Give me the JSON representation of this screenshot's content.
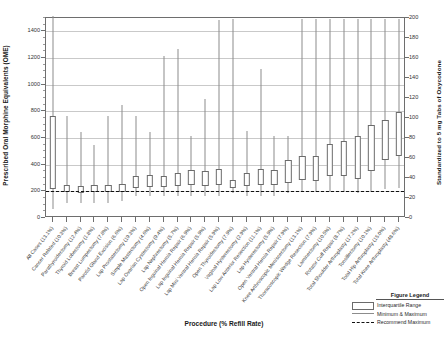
{
  "axes": {
    "y_left_title": "Prescribed Oral Morphine Equivalents (OME)",
    "y_right_title": "Standardized to 5 mg Tabs of Oxycodone",
    "x_title": "Procedure (% Refill Rate)",
    "y_left_ticks": [
      0,
      200,
      400,
      600,
      800,
      1000,
      1200,
      1400
    ],
    "y_right_ticks": [
      0,
      20,
      40,
      60,
      80,
      100,
      120,
      140,
      160,
      180,
      200
    ]
  },
  "legend": {
    "title": "Figure Legend",
    "items": [
      {
        "key": "iqr",
        "label": "Interquartile Range"
      },
      {
        "key": "minmax",
        "label": "Minimum & Maximum"
      },
      {
        "key": "reco",
        "label": "Recommend Maximum"
      }
    ]
  },
  "chart_data": {
    "type": "box",
    "title": "",
    "xlabel": "Procedure (% Refill Rate)",
    "ylabel": "Prescribed Oral Morphine Equivalents (OME)",
    "ylabel_secondary": "Standardized to 5 mg Tabs of Oxycodone",
    "ylim": [
      0,
      1500
    ],
    "ylim_secondary": [
      0,
      200
    ],
    "grid": true,
    "legend_position": "bottom-right",
    "recommended_maximum": 200,
    "categories": [
      "All Cases (13.1%)",
      "Cancer Related (10.3%)",
      "Parathyroidectomy (12.4%)",
      "Thyroid Lobectomy (1.8%)",
      "Breast Lumpectomy (7.8%)",
      "Parotid Gland Excision (6.6%)",
      "Lap Prostatectomy (19.3%)",
      "Simple Mastectomy (4.6%)",
      "Lap Ovarian Cystectomy (9.4%)",
      "Lap Nephrectomy (5.7%)",
      "Open Inguinal Hernia Repair (6.9%)",
      "Lap Inguinal Hernia Repair (5.9%)",
      "Lap Mini Ventral Hernia Repair (5.9%)",
      "Open Thyroidectomy (7.9%)",
      "Vaginal Hysterectomy (2.9%)",
      "Lap Low Anterior Resection (11.1%)",
      "Lap Hysterectomy (5.9%)",
      "Open Ventral Hernia Repair (7.9%)",
      "Knee Arthroscopic Meniscectomy (13.1%)",
      "Thoracoscopic Wedge Resection (7.9%)",
      "Laminectomy (10.5%)",
      "Rotator Cuff Repair (8.7%)",
      "Total Shoulder Arthroplasty (17.2%)",
      "Tonsillectomy (10.1%)",
      "Total Hip Arthroplasty (15.0%)",
      "Total Knee Arthroplasty (48.6%)"
    ],
    "series": [
      {
        "name": "OME distribution",
        "boxes": [
          {
            "min": 50,
            "q1": 200,
            "q3": 750,
            "max": 1500
          },
          {
            "min": 100,
            "q1": 180,
            "q3": 230,
            "max": 750
          },
          {
            "min": 100,
            "q1": 175,
            "q3": 225,
            "max": 630
          },
          {
            "min": 100,
            "q1": 180,
            "q3": 230,
            "max": 530
          },
          {
            "min": 100,
            "q1": 180,
            "q3": 235,
            "max": 750
          },
          {
            "min": 110,
            "q1": 180,
            "q3": 240,
            "max": 830
          },
          {
            "min": 150,
            "q1": 210,
            "q3": 300,
            "max": 750
          },
          {
            "min": 150,
            "q1": 215,
            "q3": 305,
            "max": 630
          },
          {
            "min": 150,
            "q1": 215,
            "q3": 300,
            "max": 1200
          },
          {
            "min": 150,
            "q1": 225,
            "q3": 320,
            "max": 1250
          },
          {
            "min": 150,
            "q1": 230,
            "q3": 345,
            "max": 600
          },
          {
            "min": 150,
            "q1": 225,
            "q3": 340,
            "max": 880
          },
          {
            "min": 150,
            "q1": 230,
            "q3": 350,
            "max": 1470
          },
          {
            "min": 170,
            "q1": 210,
            "q3": 270,
            "max": 1480
          },
          {
            "min": 150,
            "q1": 225,
            "q3": 320,
            "max": 640
          },
          {
            "min": 150,
            "q1": 230,
            "q3": 350,
            "max": 1100
          },
          {
            "min": 150,
            "q1": 230,
            "q3": 345,
            "max": 600
          },
          {
            "min": 170,
            "q1": 250,
            "q3": 420,
            "max": 600
          },
          {
            "min": 180,
            "q1": 270,
            "q3": 450,
            "max": 1480
          },
          {
            "min": 180,
            "q1": 265,
            "q3": 450,
            "max": 1480
          },
          {
            "min": 180,
            "q1": 300,
            "q3": 540,
            "max": 1480
          },
          {
            "min": 180,
            "q1": 300,
            "q3": 560,
            "max": 1480
          },
          {
            "min": 170,
            "q1": 280,
            "q3": 600,
            "max": 1480
          },
          {
            "min": 180,
            "q1": 340,
            "q3": 680,
            "max": 1480
          },
          {
            "min": 200,
            "q1": 420,
            "q3": 720,
            "max": 1480
          },
          {
            "min": 210,
            "q1": 450,
            "q3": 780,
            "max": 1480
          }
        ]
      }
    ]
  }
}
